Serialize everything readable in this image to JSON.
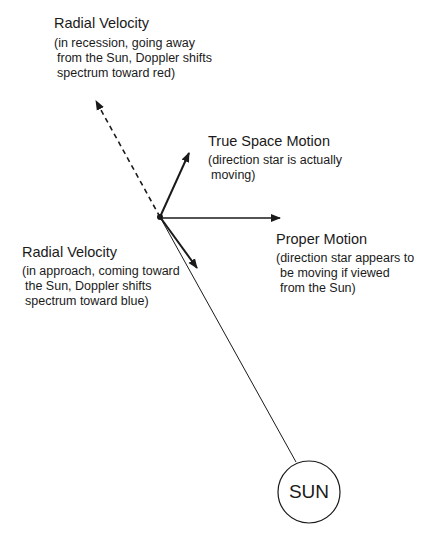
{
  "labels": {
    "radial_recession": {
      "title": "Radial Velocity",
      "lines": [
        "(in recession, going away",
        " from the Sun, Doppler shifts",
        " spectrum toward red)"
      ]
    },
    "true_space_motion": {
      "title": "True Space Motion",
      "lines": [
        "(direction star is actually",
        " moving)"
      ]
    },
    "proper_motion": {
      "title": "Proper Motion",
      "lines": [
        "(direction star appears to",
        " be moving if viewed",
        " from the Sun)"
      ]
    },
    "radial_approach": {
      "title": "Radial Velocity",
      "lines": [
        "(in approach, coming toward",
        " the Sun, Doppler shifts",
        " spectrum toward blue)"
      ]
    },
    "sun": "SUN"
  },
  "colors": {
    "ink": "#1a1a1a",
    "background": "#ffffff"
  }
}
